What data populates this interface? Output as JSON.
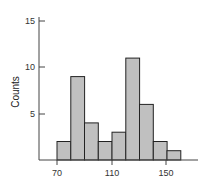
{
  "chart_data": {
    "type": "bar",
    "subtype": "histogram",
    "title": "",
    "xlabel": "",
    "ylabel": "Counts",
    "bin_width": 10,
    "bin_edges": [
      70,
      80,
      90,
      100,
      110,
      120,
      130,
      140,
      150,
      160
    ],
    "categories": [
      "70-80",
      "80-90",
      "90-100",
      "100-110",
      "110-120",
      "120-130",
      "130-140",
      "140-150",
      "150-160"
    ],
    "values": [
      2,
      9,
      4,
      2,
      3,
      11,
      6,
      2,
      1
    ],
    "ylim": [
      0,
      15
    ],
    "xlim": [
      56,
      178
    ],
    "y_ticks": [
      5,
      10,
      15
    ],
    "x_ticks": [
      70,
      110,
      150
    ],
    "grid": false,
    "legend": null,
    "bar_color": "#c0c0c0",
    "bar_edge_color": "#222222"
  },
  "labels": {
    "y_axis_title": "Counts",
    "y_tick_5": "5",
    "y_tick_10": "10",
    "y_tick_15": "15",
    "x_tick_70": "70",
    "x_tick_110": "110",
    "x_tick_150": "150"
  }
}
